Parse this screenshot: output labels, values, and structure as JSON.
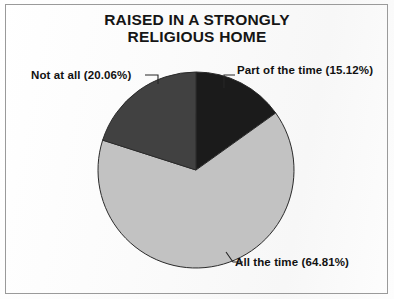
{
  "chart_data": {
    "type": "pie",
    "title": "RAISED IN A STRONGLY\nRELIGIOUS HOME",
    "xlabel": "",
    "ylabel": "",
    "legend_position": "none",
    "grid": false,
    "start_angle_deg": 0,
    "direction": "clockwise",
    "categories": [
      "Part of the time",
      "All the time",
      "Not at all"
    ],
    "values": [
      15.12,
      64.81,
      20.06
    ],
    "unit": "%",
    "slices": [
      {
        "name": "Part of the time",
        "value": 15.12,
        "label": "Part of the time (15.12%)",
        "color": "#1b1b1b",
        "sweep_deg": 54.43,
        "start_deg": 0
      },
      {
        "name": "All the time",
        "value": 64.81,
        "label": "All the time (64.81%)",
        "color": "#c2c2c2",
        "sweep_deg": 233.32,
        "start_deg": 54.43
      },
      {
        "name": "Not at all",
        "value": 20.06,
        "label": "Not at all (20.06%)",
        "color": "#414141",
        "sweep_deg": 72.22,
        "start_deg": 287.75
      }
    ],
    "annotations": [
      "Not at all (20.06%)",
      "Part of the time (15.12%)",
      "All the time (64.81%)"
    ]
  },
  "figure": {
    "border_color": "#9a9a9a",
    "background_color": "#fdfdfd",
    "outline_color": "#2a2a2a"
  }
}
